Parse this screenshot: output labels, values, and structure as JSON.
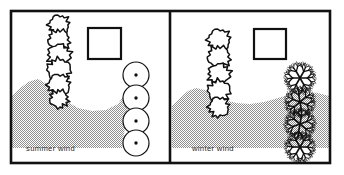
{
  "figure": {
    "type": "line-drawing-diagram",
    "background_color": "#ffffff",
    "ink_color": "#111111",
    "shade_color": "#a9a9a9",
    "frame": {
      "x": 11,
      "y": 11,
      "width": 319,
      "height": 152,
      "stroke_width": 2.6,
      "divider_x": 170
    }
  },
  "panels": [
    {
      "id": "summer",
      "caption": "summer wind",
      "caption_x": 26,
      "caption_y": 151,
      "building": {
        "x": 88,
        "y": 28,
        "width": 33,
        "height": 31,
        "stroke_width": 2.2
      },
      "evergreen_column": {
        "label": "evergreen-tree-column",
        "cx": 59,
        "count": 6,
        "cys": [
          25,
          40,
          55,
          70,
          85,
          99
        ],
        "radii": [
          10,
          10.5,
          11,
          11.5,
          11,
          9
        ],
        "texture": "spiky"
      },
      "canopy_column": {
        "label": "deciduous-canopy-column",
        "cx": 136,
        "count": 4,
        "cys": [
          75,
          98,
          121,
          143
        ],
        "radius": 13,
        "dot_radius": 1.7,
        "texture": "smooth"
      },
      "wind_flow": {
        "label": "summer-wind-flow-band",
        "direction": "left-to-right, deflected down into site",
        "shape": "dipping-scoop"
      }
    },
    {
      "id": "winter",
      "caption": "winter wind",
      "caption_x": 192,
      "caption_y": 151,
      "building": {
        "x": 254,
        "y": 29,
        "width": 32,
        "height": 30,
        "stroke_width": 2.2
      },
      "evergreen_column": {
        "label": "evergreen-tree-column",
        "cx": 219,
        "count": 5,
        "cys": [
          40,
          57,
          74,
          91,
          107
        ],
        "radii": [
          11,
          11,
          10.5,
          11,
          10
        ],
        "texture": "spiky"
      },
      "bare_tree_column": {
        "label": "bare-deciduous-tree-column",
        "cx": 300,
        "count": 4,
        "cys": [
          78,
          102,
          124,
          147
        ],
        "spread": 16,
        "texture": "branching"
      },
      "wind_flow": {
        "label": "winter-wind-flow-band",
        "direction": "left-to-right, horizontal over site",
        "shape": "flat-band"
      }
    }
  ],
  "legend_note": {
    "summer_label": "summer wind",
    "winter_label": "winter wind"
  }
}
